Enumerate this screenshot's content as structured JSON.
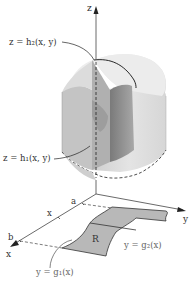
{
  "figure": {
    "type": "3D region between two surfaces over a planar region",
    "axes": {
      "z_label": "z",
      "y_label": "y",
      "x_label": "x"
    },
    "labels": {
      "top_surface": "z = h₂(x, y)",
      "bottom_surface": "z = h₁(x, y)",
      "region": "R",
      "upper_curve": "y = g₂(x)",
      "lower_curve": "y = g₁(x)",
      "x_tick_a": "a",
      "x_tick_x": "x",
      "x_tick_b": "b"
    },
    "colors": {
      "solid_light": "#e6e6e6",
      "solid_mid": "#c8c8c8",
      "solid_dark": "#8f8f8f",
      "region_fill": "#b4b4b4",
      "axis": "#333333",
      "text": "#333333"
    }
  }
}
